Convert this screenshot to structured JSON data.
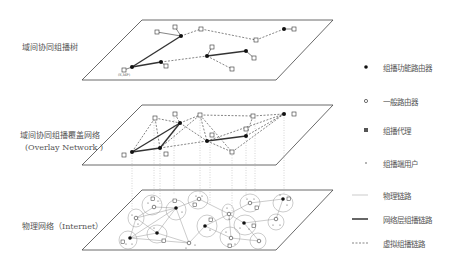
{
  "layers": [
    {
      "id": "tree",
      "label": "域间协同组播树",
      "sub": ""
    },
    {
      "id": "overlay",
      "label": "域间协同组播覆盖网络",
      "sub": "(Overlay Network )"
    },
    {
      "id": "physical",
      "label": "物理网络（Internet）",
      "sub": ""
    }
  ],
  "root_label": "(S,MP)",
  "legend": [
    {
      "icon": "multicast-router",
      "label": "组播功能路由器"
    },
    {
      "icon": "general-router",
      "label": "一般路由器"
    },
    {
      "icon": "multicast-agent",
      "label": "组播代理"
    },
    {
      "icon": "end-user",
      "label": "组播端用户"
    },
    {
      "icon": "physical-link",
      "label": "物理链路"
    },
    {
      "icon": "network-multicast-link",
      "label": "网络层组播链路"
    },
    {
      "icon": "virtual-multicast-link",
      "label": "虚拟组播链路"
    }
  ],
  "colors": {
    "line": "#333333",
    "thin": "#999999",
    "text": "#555555"
  }
}
